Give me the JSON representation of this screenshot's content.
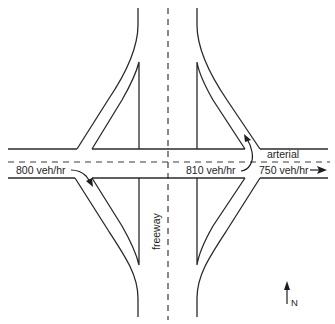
{
  "diagram": {
    "type": "diamond interchange",
    "labels": {
      "arterial": "arterial",
      "freeway": "freeway",
      "west_approach_flow": "800 veh/hr",
      "offramp_flow": "810 veh/hr",
      "east_departure_flow": "750 veh/hr",
      "north": "N"
    },
    "colors": {
      "line": "#2a2a2a",
      "background": "#ffffff"
    }
  }
}
